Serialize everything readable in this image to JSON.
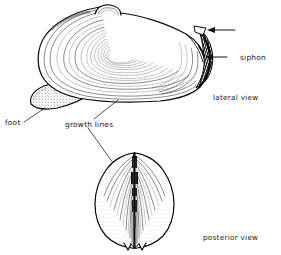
{
  "figure": {
    "background_color": "#ffffff",
    "ink_color": "#101010",
    "width": 281,
    "height": 255
  },
  "labels": {
    "siphon": "siphon",
    "foot": "foot",
    "growth_lines": "growth lines",
    "lateral_view": "lateral view",
    "posterior_view": "posterior view"
  },
  "views": [
    {
      "id": "lateral",
      "caption": "lateral view",
      "parts": [
        "siphon",
        "foot",
        "growth lines",
        "umbo"
      ]
    },
    {
      "id": "posterior",
      "caption": "posterior view",
      "parts": [
        "growth lines",
        "hinge",
        "gape"
      ]
    }
  ],
  "annotations": [
    {
      "name": "siphon",
      "text": "siphon",
      "pointer": "arrow-left",
      "view": "lateral"
    },
    {
      "name": "siphon-upper",
      "text": "",
      "pointer": "arrow-left",
      "view": "lateral"
    },
    {
      "name": "foot",
      "text": "foot",
      "pointer": "leader-line",
      "view": "lateral"
    },
    {
      "name": "growth-lines",
      "text": "growth lines",
      "pointer": "leader-line",
      "view": "both"
    }
  ]
}
